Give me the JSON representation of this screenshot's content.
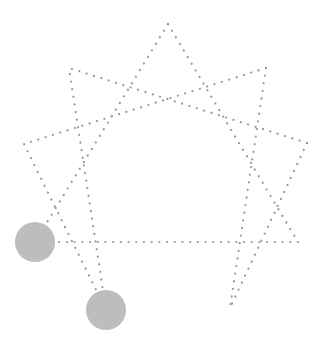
{
  "diagram": {
    "type": "nine-pointed-star",
    "stroke_color": "#9a9a9a",
    "marker_color": "#bdbdbd",
    "vertices": [
      {
        "id": "v0",
        "x": 168,
        "y": 24
      },
      {
        "id": "v1",
        "x": 266,
        "y": 68
      },
      {
        "id": "v2",
        "x": 307,
        "y": 143
      },
      {
        "id": "v3",
        "x": 298,
        "y": 242
      },
      {
        "id": "v4",
        "x": 230,
        "y": 308
      },
      {
        "id": "v5",
        "x": 106,
        "y": 310
      },
      {
        "id": "v6",
        "x": 35,
        "y": 242
      },
      {
        "id": "v7",
        "x": 24,
        "y": 144
      },
      {
        "id": "v8",
        "x": 69,
        "y": 68
      }
    ],
    "edges": [
      [
        "v0",
        "v3"
      ],
      [
        "v0",
        "v6"
      ],
      [
        "v1",
        "v4"
      ],
      [
        "v1",
        "v7"
      ],
      [
        "v2",
        "v8"
      ],
      [
        "v2",
        "v4"
      ],
      [
        "v3",
        "v6"
      ],
      [
        "v5",
        "v8"
      ],
      [
        "v5",
        "v7"
      ]
    ],
    "markers": [
      {
        "id": "marker-lower-left",
        "vertex": "v6",
        "cx": 35,
        "cy": 242,
        "r": 20
      },
      {
        "id": "marker-bottom-left",
        "vertex": "v5",
        "cx": 106,
        "cy": 310,
        "r": 20
      }
    ]
  }
}
